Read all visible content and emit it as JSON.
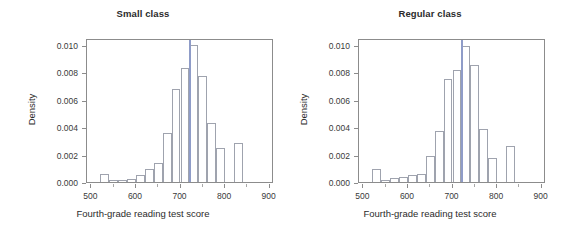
{
  "figure": {
    "background": "#ffffff",
    "bar_edge_color": "#9fa3ae",
    "frame_color": "#8c8c8c",
    "vline_color": "#8f9cc8",
    "text_color": "#2b2b2b"
  },
  "chart_data": [
    {
      "type": "bar",
      "title": "Small class",
      "xlabel": "Fourth-grade reading test score",
      "ylabel": "Density",
      "xlim": [
        490,
        910
      ],
      "ylim": [
        0.0,
        0.0105
      ],
      "xticks": [
        500,
        600,
        700,
        800,
        900
      ],
      "xtick_labels": [
        "500",
        "600",
        "700",
        "800",
        "900"
      ],
      "xminor_ticks": [
        550,
        650,
        750,
        850
      ],
      "yticks": [
        0.0,
        0.002,
        0.004,
        0.006,
        0.008,
        0.01
      ],
      "ytick_labels": [
        "0.000",
        "0.002",
        "0.004",
        "0.006",
        "0.008",
        "0.010"
      ],
      "grid": false,
      "legend": "none",
      "bin_width": 20,
      "bin_starts": [
        520,
        540,
        560,
        580,
        600,
        620,
        640,
        660,
        680,
        700,
        720,
        740,
        760,
        780,
        800,
        820
      ],
      "values": [
        0.0006,
        0.00018,
        0.00018,
        0.00022,
        0.00052,
        0.00096,
        0.00138,
        0.0036,
        0.0068,
        0.00832,
        0.01,
        0.00772,
        0.0043,
        0.00245,
        0.0,
        0.00282
      ],
      "annotations": [
        {
          "name": "mean-reference-line",
          "type": "vline",
          "x": 721,
          "color": "#8f9cc8"
        }
      ]
    },
    {
      "type": "bar",
      "title": "Regular class",
      "xlabel": "Fourth-grade reading test score",
      "ylabel": "Density",
      "xlim": [
        490,
        910
      ],
      "ylim": [
        0.0,
        0.0105
      ],
      "xticks": [
        500,
        600,
        700,
        800,
        900
      ],
      "xtick_labels": [
        "500",
        "600",
        "700",
        "800",
        "900"
      ],
      "xminor_ticks": [
        550,
        650,
        750,
        850
      ],
      "yticks": [
        0.0,
        0.002,
        0.004,
        0.006,
        0.008,
        0.01
      ],
      "ytick_labels": [
        "0.000",
        "0.002",
        "0.004",
        "0.006",
        "0.008",
        "0.010"
      ],
      "grid": false,
      "legend": "none",
      "bin_width": 20,
      "bin_starts": [
        520,
        540,
        560,
        580,
        600,
        620,
        640,
        660,
        680,
        700,
        720,
        740,
        760,
        780,
        800,
        820
      ],
      "values": [
        0.00092,
        0.00015,
        0.00028,
        0.00038,
        0.0005,
        0.00062,
        0.00188,
        0.0037,
        0.00748,
        0.00818,
        0.00995,
        0.00852,
        0.00385,
        0.00175,
        0.0,
        0.00262
      ],
      "annotations": [
        {
          "name": "mean-reference-line",
          "type": "vline",
          "x": 721,
          "color": "#8f9cc8"
        }
      ]
    }
  ]
}
